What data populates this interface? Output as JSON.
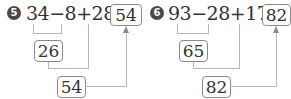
{
  "problems": [
    {
      "number": "5",
      "expression": "34−8+28=",
      "answer": "54",
      "step1_result": "26",
      "step2_result": "54"
    },
    {
      "number": "6",
      "expression": "93−28+17=",
      "answer": "82",
      "step1_result": "65",
      "step2_result": "82"
    }
  ]
}
